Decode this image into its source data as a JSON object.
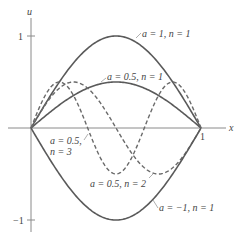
{
  "chart_data": {
    "type": "line",
    "title": "",
    "xlabel": "x",
    "ylabel": "u",
    "xlim": [
      0,
      1
    ],
    "ylim": [
      -1,
      1
    ],
    "grid": false,
    "x_ticks": [
      "1"
    ],
    "y_ticks": [
      "1",
      "-1"
    ],
    "function": "u = a sin(n π x)",
    "series": [
      {
        "name": "a = 1, n = 1",
        "a": 1,
        "n": 1,
        "style": "solid",
        "label": "a = 1, n = 1"
      },
      {
        "name": "a = 0.5, n = 1",
        "a": 0.5,
        "n": 1,
        "style": "solid",
        "label": "a = 0.5, n = 1"
      },
      {
        "name": "a = 0.5, n = 2",
        "a": 0.5,
        "n": 2,
        "style": "dashed",
        "label": "a = 0.5, n = 2"
      },
      {
        "name": "a = 0.5, n = 3",
        "a": 0.5,
        "n": 3,
        "style": "dashed",
        "label_line1": "a = 0.5,",
        "label_line2": "n = 3"
      },
      {
        "name": "a = -1, n = 1",
        "a": -1,
        "n": 1,
        "style": "solid",
        "label": "a = −1, n = 1"
      }
    ]
  },
  "labels": {
    "x_axis": "x",
    "y_axis": "u",
    "x_tick_1": "1",
    "y_tick_pos": "1",
    "y_tick_neg": "−1",
    "s1": "a = 1, n = 1",
    "s2": "a = 0.5, n = 1",
    "s3": "a = 0.5, n = 2",
    "s4a": "a = 0.5,",
    "s4b": "n = 3",
    "s5": "a = −1, n = 1"
  }
}
